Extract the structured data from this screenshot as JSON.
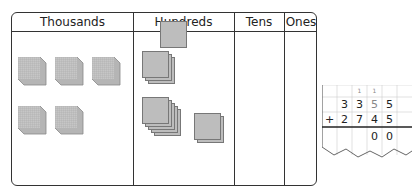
{
  "place_value_table": {
    "headers": [
      "Thousands",
      "Hundreds",
      "Tens",
      "Ones"
    ],
    "thousands": {
      "cubes": 5
    },
    "hundreds": {
      "groups": [
        1,
        3,
        5,
        2
      ],
      "flats_total": 11
    },
    "tens": {
      "count": 0
    },
    "ones": {
      "count": 0
    }
  },
  "column_addition": {
    "carries": [
      "",
      "",
      "1",
      "1",
      ""
    ],
    "row1": [
      "",
      "3",
      "3",
      "5",
      "5"
    ],
    "operator": "+",
    "row2": [
      "",
      "2",
      "7",
      "4",
      "5"
    ],
    "result": [
      "",
      "",
      "",
      "0",
      "0"
    ]
  }
}
